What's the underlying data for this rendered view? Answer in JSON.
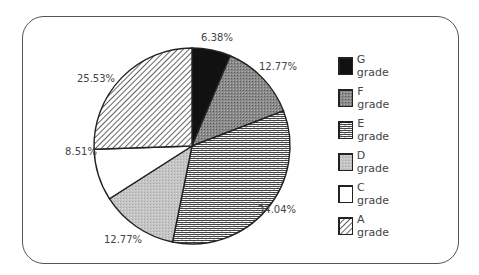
{
  "chart_data": {
    "type": "pie",
    "title": "",
    "categories": [
      "G grade",
      "F grade",
      "E grade",
      "D grade",
      "C grade",
      "A grade"
    ],
    "values": [
      6.38,
      12.77,
      34.04,
      12.77,
      8.51,
      25.53
    ],
    "labels": [
      "6.38%",
      "12.77%",
      "34.04%",
      "12.77%",
      "8.51%",
      "25.53%"
    ],
    "start_angle": "12 o'clock",
    "direction": "clockwise",
    "legend_position": "right",
    "fills": [
      "solid-black",
      "dark-gray-stipple",
      "brick-pattern",
      "light-gray-stipple",
      "white",
      "diagonal-hatch"
    ]
  },
  "legend": {
    "items": [
      {
        "label": "G grade"
      },
      {
        "label": "F grade"
      },
      {
        "label": "E grade"
      },
      {
        "label": "D grade"
      },
      {
        "label": "C grade"
      },
      {
        "label": "A grade"
      }
    ]
  }
}
